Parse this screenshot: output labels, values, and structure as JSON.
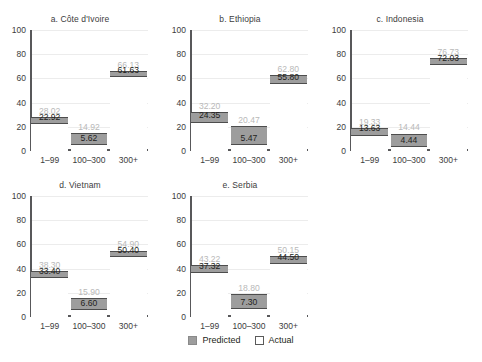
{
  "chart_data": {
    "type": "bar",
    "title": "",
    "xlabel": "",
    "ylabel": "",
    "ylim": [
      0,
      100
    ],
    "yticks": [
      0,
      20,
      40,
      60,
      80,
      100
    ],
    "categories": [
      "1–99",
      "100–300",
      "300+"
    ],
    "grid": true,
    "legend_position": "bottom-center",
    "series": [
      {
        "name": "Predicted",
        "color": "#9d9d9d"
      },
      {
        "name": "Actual",
        "color": "#ffffff"
      }
    ],
    "panels": [
      {
        "title": "a. Côte d'Ivoire",
        "predicted": [
          28.02,
          14.92,
          66.13
        ],
        "actual": [
          22.92,
          5.62,
          61.63
        ],
        "predicted_labels": [
          "28.02",
          "14.92",
          "66.13"
        ],
        "actual_labels": [
          "22.92",
          "5.62",
          "61.63"
        ]
      },
      {
        "title": "b. Ethiopia",
        "predicted": [
          32.2,
          20.47,
          62.8
        ],
        "actual": [
          24.35,
          5.47,
          55.8
        ],
        "predicted_labels": [
          "32.20",
          "20.47",
          "62.80"
        ],
        "actual_labels": [
          "24.35",
          "5.47",
          "55.80"
        ]
      },
      {
        "title": "c. Indonesia",
        "predicted": [
          19.33,
          14.44,
          76.73
        ],
        "actual": [
          13.63,
          4.44,
          72.03
        ],
        "predicted_labels": [
          "19.33",
          "14.44",
          "76.73"
        ],
        "actual_labels": [
          "13.63",
          "4.44",
          "72.03"
        ]
      },
      {
        "title": "d. Vietnam",
        "predicted": [
          38.3,
          15.9,
          54.9
        ],
        "actual": [
          33.4,
          6.6,
          50.4
        ],
        "predicted_labels": [
          "38.30",
          "15.90",
          "54.90"
        ],
        "actual_labels": [
          "33.40",
          "6.60",
          "50.40"
        ]
      },
      {
        "title": "e. Serbia",
        "predicted": [
          43.22,
          18.8,
          50.15
        ],
        "actual": [
          37.32,
          7.3,
          44.5
        ],
        "predicted_labels": [
          "43.22",
          "18.80",
          "50.15"
        ],
        "actual_labels": [
          "37.32",
          "7.30",
          "44.50"
        ]
      }
    ]
  },
  "legend": {
    "predicted_label": "Predicted",
    "actual_label": "Actual"
  }
}
